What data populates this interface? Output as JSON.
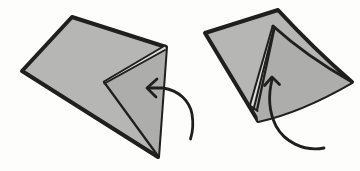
{
  "meta": {
    "diagram_kind": "origami-fold-instruction",
    "background_color": "#fdfdfc",
    "paper_color": "#b6b6b5",
    "paper_shade_color": "#adadac",
    "ink_color": "#1f1f1e",
    "fold_gap_color": "#dcdcda"
  },
  "steps": [
    {
      "name": "fold-flap-left",
      "outline_path": "M72,17 L166,47 L158,157 L22,71 Z",
      "shade_path": "M104,82 L166,47 L158,157 Z",
      "fold_gap_path": "M104,82 L165,45.5 L165,50 Z",
      "fold_edge_a_path": "M104,81.5 L165,45.5",
      "fold_edge_b_path": "M104.5,83.5 L165,50",
      "crease_path": "M104,82 L158,156",
      "arrow_shaft_path": "M148,88 L163,88 C179,90.5 189.5,101 192,114 C193.5,123 193,131 190.5,139",
      "arrow_head_points": "157,79 147,88 156,97"
    },
    {
      "name": "fold-flap-up",
      "outline_path": "M278,10 Q313,48 352,82 Q300,112 258,121 L205,33 Z",
      "shade_path": "M273,26 Q306,56 352,82 Q300,112 258,121 L257,110 Z",
      "flap_top_edge_path": "M273,26 Q306,56 352,82",
      "fold_gap_path": "M273,26 L250,105 L253.5,109.5 Z",
      "fold_edge_a_path": "M272.5,26.5 L250,105",
      "fold_edge_b_path": "M274,27.5 L253.5,109.5",
      "flap_right_edge_path": "M274.5,28 L257,110",
      "flap_base_path": "M250,105.5 L257.5,111",
      "arrow_shaft_path": "M272,80 C268,96 269,112 276,126 C284,141 303,152 324,148",
      "arrow_head_points": "264.5,85.5 272,77 279.5,84.5"
    }
  ]
}
